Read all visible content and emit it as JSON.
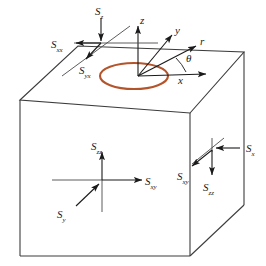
{
  "figure": {
    "background_color": "#ffffff",
    "line_color": "#3c3c3c",
    "arrow_color": "#1a1a1a",
    "wellbore_color": "#b4542a"
  },
  "axes": {
    "origin_label": "",
    "items": [
      {
        "name": "z-axis",
        "label": "z"
      },
      {
        "name": "y-axis",
        "label": "y"
      },
      {
        "name": "r-axis",
        "label": "r"
      },
      {
        "name": "x-axis",
        "label": "x"
      }
    ],
    "angle": {
      "name": "theta-angle",
      "label": "θ"
    }
  },
  "wellbore": {
    "label": "",
    "shape": "ellipse",
    "color": "#b4542a"
  },
  "stress_labels": {
    "top_face": [
      {
        "name": "stress-sz-top",
        "base": "S",
        "sub": "z"
      },
      {
        "name": "stress-sxx-top",
        "base": "S",
        "sub": "xx"
      },
      {
        "name": "stress-syx-top",
        "base": "S",
        "sub": "yx"
      }
    ],
    "front_face": [
      {
        "name": "stress-szz-front",
        "base": "S",
        "sub": "zz"
      },
      {
        "name": "stress-sxy-front",
        "base": "S",
        "sub": "xy"
      },
      {
        "name": "stress-sy-front",
        "base": "S",
        "sub": "y"
      }
    ],
    "right_face": [
      {
        "name": "stress-sx-right",
        "base": "S",
        "sub": "x"
      },
      {
        "name": "stress-sxy-right",
        "base": "S",
        "sub": "xy"
      },
      {
        "name": "stress-szz-right",
        "base": "S",
        "sub": "zz"
      }
    ]
  }
}
